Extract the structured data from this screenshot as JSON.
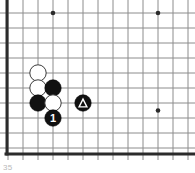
{
  "diagram": {
    "kind": "go-board-diagram",
    "caption": "35",
    "board": {
      "columns": 13,
      "rows": 10,
      "cell_size": 15,
      "origin_x": 8,
      "origin_y": 13,
      "line_color": "#8c8c8c",
      "edge_color": "#2b2b2b",
      "edge_width": 3,
      "line_width": 1,
      "background_color": "#ffffff",
      "left_edge_is_border": true,
      "bottom_edge_is_border": true,
      "top_edge_is_border": false,
      "right_edge_is_border": false
    },
    "star_points": [
      {
        "name": "star-point-upper-left",
        "col": 3,
        "row": 0
      },
      {
        "name": "star-point-upper-right",
        "col": 10,
        "row": 0
      },
      {
        "name": "star-point-lower-right",
        "col": 10,
        "row": 6.5
      }
    ],
    "stones": [
      {
        "name": "white-stone-a",
        "color": "white",
        "col": 2,
        "row": 4,
        "mark": "",
        "mark_color": ""
      },
      {
        "name": "white-stone-b",
        "color": "white",
        "col": 2,
        "row": 5,
        "mark": "",
        "mark_color": ""
      },
      {
        "name": "black-stone-a",
        "color": "black",
        "col": 3,
        "row": 5,
        "mark": "",
        "mark_color": ""
      },
      {
        "name": "black-stone-b",
        "color": "black",
        "col": 2,
        "row": 6,
        "mark": "",
        "mark_color": ""
      },
      {
        "name": "white-stone-c",
        "color": "white",
        "col": 3,
        "row": 6,
        "mark": "",
        "mark_color": ""
      },
      {
        "name": "black-stone-move-1",
        "color": "black",
        "col": 3,
        "row": 7,
        "mark": "1",
        "mark_color": "#ffffff"
      },
      {
        "name": "black-stone-triangle",
        "color": "black",
        "col": 5,
        "row": 6,
        "mark": "triangle",
        "mark_color": "#ffffff"
      }
    ],
    "stone_style": {
      "radius": 8.2,
      "black_fill": "#111111",
      "black_stroke": "#000000",
      "white_fill": "#ffffff",
      "white_stroke": "#3a3a3a",
      "white_stroke_width": 1
    }
  }
}
